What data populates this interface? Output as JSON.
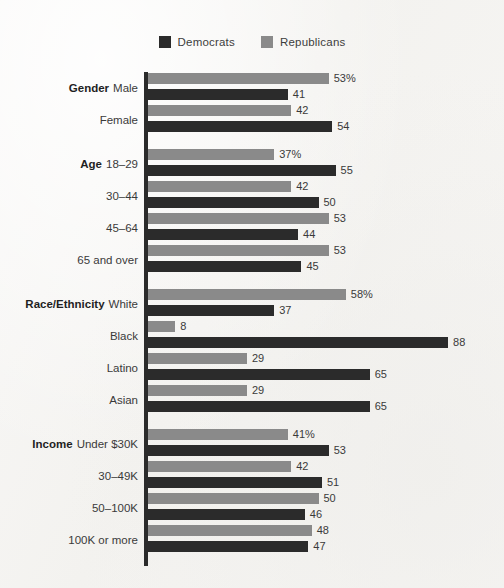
{
  "legend": {
    "items": [
      {
        "label": "Democrats",
        "color": "#2b2b2b",
        "key": "dem"
      },
      {
        "label": "Republicans",
        "color": "#8a8a8a",
        "key": "rep"
      }
    ]
  },
  "chart_data": {
    "type": "bar",
    "orientation": "horizontal",
    "title": "",
    "xlabel": "",
    "ylabel": "",
    "xlim": [
      0,
      88
    ],
    "grid": false,
    "legend_position": "top-center",
    "legend": [
      "Democrats",
      "Republicans"
    ],
    "series": [
      {
        "name": "Republicans",
        "color": "#8a8a8a",
        "values": [
          53,
          42,
          37,
          42,
          53,
          53,
          58,
          8,
          29,
          29,
          41,
          42,
          50,
          48
        ]
      },
      {
        "name": "Democrats",
        "color": "#2b2b2b",
        "values": [
          41,
          54,
          55,
          50,
          44,
          45,
          37,
          88,
          65,
          65,
          53,
          51,
          46,
          47
        ]
      }
    ],
    "categories": [
      "Male",
      "Female",
      "18–29",
      "30–44",
      "45–64",
      "65 and over",
      "White",
      "Black",
      "Latino",
      "Asian",
      "Under $30K",
      "30–49K",
      "50–100K",
      "100K or more"
    ],
    "groups": [
      {
        "category": "Gender",
        "rows": [
          {
            "label": "Male",
            "category": "Gender",
            "rep": 53,
            "dem": 41,
            "rep_text": "53%",
            "dem_text": "41"
          },
          {
            "label": "Female",
            "category": "",
            "rep": 42,
            "dem": 54,
            "rep_text": "42",
            "dem_text": "54"
          }
        ]
      },
      {
        "category": "Age",
        "rows": [
          {
            "label": "18–29",
            "category": "Age",
            "rep": 37,
            "dem": 55,
            "rep_text": "37%",
            "dem_text": "55"
          },
          {
            "label": "30–44",
            "category": "",
            "rep": 42,
            "dem": 50,
            "rep_text": "42",
            "dem_text": "50"
          },
          {
            "label": "45–64",
            "category": "",
            "rep": 53,
            "dem": 44,
            "rep_text": "53",
            "dem_text": "44"
          },
          {
            "label": "65 and over",
            "category": "",
            "rep": 53,
            "dem": 45,
            "rep_text": "53",
            "dem_text": "45"
          }
        ]
      },
      {
        "category": "Race/Ethnicity",
        "rows": [
          {
            "label": "White",
            "category": "Race/Ethnicity",
            "rep": 58,
            "dem": 37,
            "rep_text": "58%",
            "dem_text": "37"
          },
          {
            "label": "Black",
            "category": "",
            "rep": 8,
            "dem": 88,
            "rep_text": "8",
            "dem_text": "88"
          },
          {
            "label": "Latino",
            "category": "",
            "rep": 29,
            "dem": 65,
            "rep_text": "29",
            "dem_text": "65"
          },
          {
            "label": "Asian",
            "category": "",
            "rep": 29,
            "dem": 65,
            "rep_text": "29",
            "dem_text": "65"
          }
        ]
      },
      {
        "category": "Income",
        "rows": [
          {
            "label": "Under $30K",
            "category": "Income",
            "rep": 41,
            "dem": 53,
            "rep_text": "41%",
            "dem_text": "53"
          },
          {
            "label": "30–49K",
            "category": "",
            "rep": 42,
            "dem": 51,
            "rep_text": "42",
            "dem_text": "51"
          },
          {
            "label": "50–100K",
            "category": "",
            "rep": 50,
            "dem": 46,
            "rep_text": "50",
            "dem_text": "46"
          },
          {
            "label": "100K or more",
            "category": "",
            "rep": 48,
            "dem": 47,
            "rep_text": "48",
            "dem_text": "47"
          }
        ]
      }
    ]
  }
}
